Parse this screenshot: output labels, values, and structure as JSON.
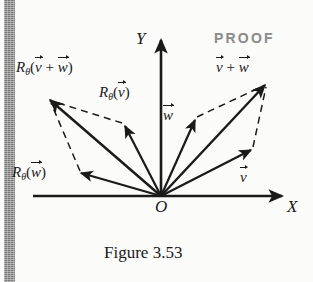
{
  "figure": {
    "caption": "Figure 3.53",
    "proof_label": "PROOF",
    "origin_label": "O",
    "axes": {
      "x_label": "X",
      "y_label": "Y"
    },
    "colors": {
      "ink": "#1a1a1a",
      "proof_gray": "#8a8a8a",
      "margin_bar": "#8e8e8e",
      "page_background": "#fbfbfa"
    },
    "labels": {
      "rotated_sum": {
        "fn": "R",
        "sub": "θ",
        "open": "(",
        "v": "v",
        "plus": "+",
        "w": "w",
        "close": ")"
      },
      "rotated_v": {
        "fn": "R",
        "sub": "θ",
        "open": "(",
        "v": "v",
        "close": ")"
      },
      "rotated_w": {
        "fn": "R",
        "sub": "θ",
        "open": "(",
        "w": "w",
        "close": ")"
      },
      "sum": {
        "v": "v",
        "plus": "+",
        "w": "w"
      },
      "vector_v": "v",
      "vector_w": "w"
    },
    "vectors": [
      {
        "name": "v",
        "label": "v",
        "style": "solid",
        "from": [
          161,
          196
        ],
        "to": [
          253,
          148
        ]
      },
      {
        "name": "w",
        "label": "w",
        "style": "solid",
        "from": [
          161,
          196
        ],
        "to": [
          196,
          118
        ]
      },
      {
        "name": "v-plus-w",
        "label": "v + w",
        "style": "solid",
        "from": [
          161,
          196
        ],
        "to": [
          267,
          82
        ]
      },
      {
        "name": "rotated-v",
        "label": "R_theta(v)",
        "style": "solid",
        "from": [
          161,
          196
        ],
        "to": [
          124,
          124
        ]
      },
      {
        "name": "rotated-w",
        "label": "R_theta(w)",
        "style": "solid",
        "from": [
          161,
          196
        ],
        "to": [
          79,
          172
        ]
      },
      {
        "name": "rotated-v-plus-w",
        "label": "R_theta(v + w)",
        "style": "solid",
        "from": [
          161,
          196
        ],
        "to": [
          48,
          98
        ]
      }
    ],
    "dashed_edges": [
      {
        "name": "right-parallelogram-top",
        "from": [
          196,
          118
        ],
        "to": [
          267,
          82
        ]
      },
      {
        "name": "right-parallelogram-side",
        "from": [
          253,
          148
        ],
        "to": [
          267,
          82
        ]
      },
      {
        "name": "left-parallelogram-top",
        "from": [
          124,
          124
        ],
        "to": [
          48,
          98
        ]
      },
      {
        "name": "left-parallelogram-side",
        "from": [
          79,
          172
        ],
        "to": [
          48,
          98
        ]
      }
    ],
    "axis_lines": [
      {
        "name": "x-axis",
        "from": [
          33,
          196
        ],
        "to": [
          284,
          196
        ]
      },
      {
        "name": "y-axis",
        "from": [
          161,
          196
        ],
        "to": [
          161,
          38
        ]
      }
    ]
  }
}
